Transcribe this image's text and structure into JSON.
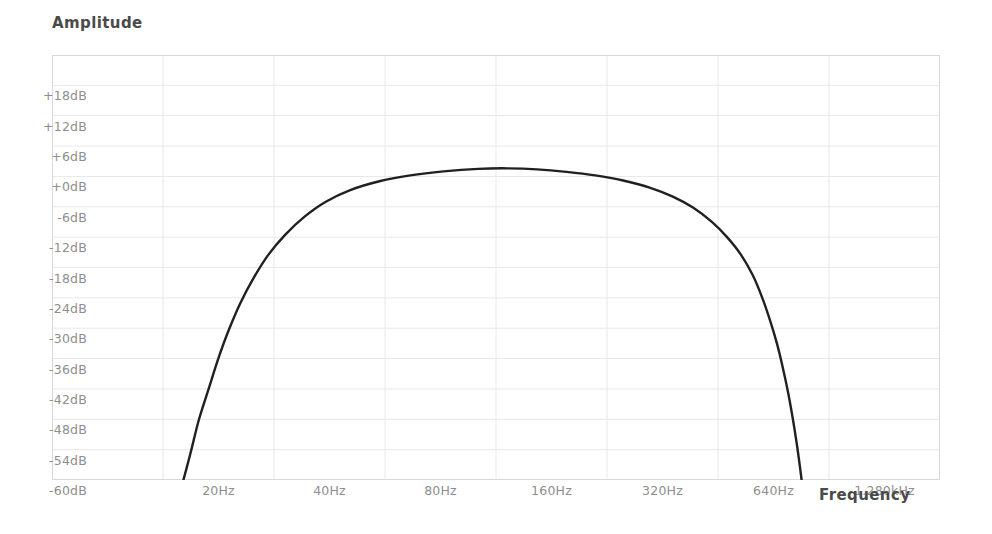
{
  "chart_data": {
    "type": "line",
    "title": "",
    "xlabel": "Frequency",
    "ylabel": "Amplitude",
    "grid": true,
    "legend": false,
    "x_scale": "log2",
    "x_tick_labels": [
      "20Hz",
      "40Hz",
      "80Hz",
      "160Hz",
      "320Hz",
      "640Hz",
      "1.280kHz"
    ],
    "x_tick_values_hz": [
      20,
      40,
      80,
      160,
      320,
      640,
      1280
    ],
    "xlim_hz": [
      14.1,
      1810
    ],
    "y_tick_labels": [
      "+18dB",
      "+12dB",
      "+6dB",
      "+0dB",
      "-6dB",
      "-12dB",
      "-18dB",
      "-24dB",
      "-30dB",
      "-36dB",
      "-42dB",
      "-48dB",
      "-54dB",
      "-60dB"
    ],
    "y_tick_values_db": [
      18,
      12,
      6,
      0,
      -6,
      -12,
      -18,
      -24,
      -30,
      -36,
      -42,
      -48,
      -54,
      -60
    ],
    "ylim_db": [
      -60,
      24
    ],
    "series": [
      {
        "name": "Bandpass response",
        "color": "#231f20",
        "line_width": 2.4,
        "points_hz_db": [
          [
            28.5,
            -62.0
          ],
          [
            30.0,
            -55.0
          ],
          [
            31.5,
            -48.0
          ],
          [
            33.2,
            -42.0
          ],
          [
            35.0,
            -36.0
          ],
          [
            37.0,
            -30.5
          ],
          [
            39.5,
            -25.0
          ],
          [
            42.5,
            -20.0
          ],
          [
            46.0,
            -15.5
          ],
          [
            50.5,
            -11.5
          ],
          [
            56.0,
            -8.0
          ],
          [
            63.0,
            -5.0
          ],
          [
            72.0,
            -2.7
          ],
          [
            84.0,
            -1.0
          ],
          [
            100.0,
            0.2
          ],
          [
            120.0,
            1.0
          ],
          [
            145.0,
            1.5
          ],
          [
            170.0,
            1.6
          ],
          [
            200.0,
            1.4
          ],
          [
            235.0,
            0.9
          ],
          [
            275.0,
            0.2
          ],
          [
            320.0,
            -0.8
          ],
          [
            370.0,
            -2.2
          ],
          [
            420.0,
            -4.0
          ],
          [
            470.0,
            -6.2
          ],
          [
            520.0,
            -9.0
          ],
          [
            565.0,
            -12.0
          ],
          [
            610.0,
            -15.5
          ],
          [
            650.0,
            -19.5
          ],
          [
            685.0,
            -24.0
          ],
          [
            715.0,
            -28.5
          ],
          [
            742.0,
            -33.0
          ],
          [
            765.0,
            -37.5
          ],
          [
            788.0,
            -42.5
          ],
          [
            808.0,
            -47.5
          ],
          [
            826.0,
            -52.5
          ],
          [
            842.0,
            -57.5
          ],
          [
            855.0,
            -62.0
          ]
        ]
      }
    ]
  },
  "axes": {
    "amplitude_label": "Amplitude",
    "frequency_label": "Frequency"
  },
  "colors": {
    "curve": "#231f20",
    "grid": "#e8e8e8",
    "grid_major": "#dcdcdc",
    "border": "#d8d8d8",
    "tick_text": "#8e8e8e",
    "title_text": "#4a4a4a",
    "background": "#ffffff"
  }
}
